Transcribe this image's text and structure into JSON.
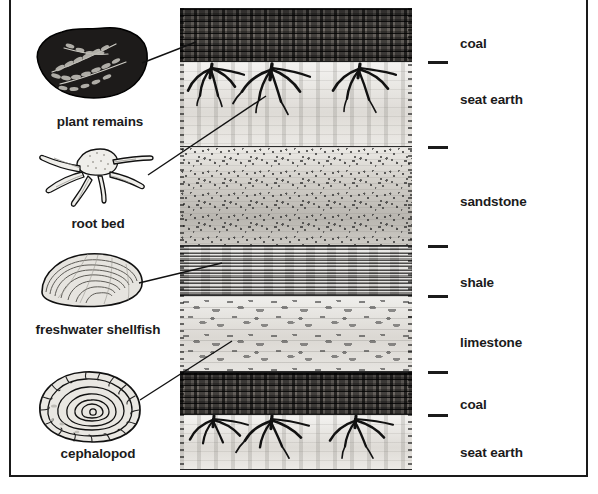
{
  "figure": {
    "type": "geological-cross-section",
    "border_color": "#1a1a1a"
  },
  "strata": {
    "column_label_ticks": 6,
    "layers": [
      {
        "id": "coal-top",
        "label": "coal",
        "rock": "coal",
        "top": 8,
        "bottom": 62,
        "label_y": 43,
        "tick_y": 62
      },
      {
        "id": "seat-earth-top",
        "label": "seat earth",
        "rock": "seat earth",
        "top": 62,
        "bottom": 147,
        "label_y": 99,
        "tick_y": 147
      },
      {
        "id": "sandstone",
        "label": "sandstone",
        "rock": "sandstone",
        "top": 147,
        "bottom": 246,
        "label_y": 201,
        "tick_y": 246
      },
      {
        "id": "shale",
        "label": "shale",
        "rock": "shale",
        "top": 246,
        "bottom": 296,
        "label_y": 282,
        "tick_y": 296
      },
      {
        "id": "limestone",
        "label": "limestone",
        "rock": "limestone",
        "top": 296,
        "bottom": 372,
        "label_y": 342,
        "tick_y": 372
      },
      {
        "id": "coal-bottom",
        "label": "coal",
        "rock": "coal",
        "top": 372,
        "bottom": 415,
        "label_y": 404,
        "tick_y": 415
      },
      {
        "id": "seat-earth-bottom",
        "label": "seat earth",
        "rock": "seat earth",
        "top": 415,
        "bottom": 470,
        "label_y": 452,
        "tick_y": null
      }
    ],
    "label_x": 460
  },
  "specimens": [
    {
      "id": "plant-remains",
      "label": "plant remains",
      "label_x": 100,
      "label_y": 122,
      "art_cx": 92,
      "art_cy": 62,
      "points_to_layer": "coal-top"
    },
    {
      "id": "root-bed",
      "label": "root bed",
      "label_x": 98,
      "label_y": 224,
      "art_cx": 95,
      "art_cy": 176,
      "points_to_layer": "seat-earth-top"
    },
    {
      "id": "freshwater-shellfish",
      "label": "freshwater shellfish",
      "label_x": 98,
      "label_y": 330,
      "art_cx": 95,
      "art_cy": 280,
      "points_to_layer": "shale"
    },
    {
      "id": "cephalopod",
      "label": "cephalopod",
      "label_x": 98,
      "label_y": 454,
      "art_cx": 92,
      "art_cy": 408,
      "points_to_layer": "limestone"
    }
  ],
  "leader_lines": [
    {
      "from_specimen": "plant-remains",
      "x1": 142,
      "y1": 63,
      "x2": 196,
      "y2": 42
    },
    {
      "from_specimen": "root-bed",
      "x1": 148,
      "y1": 175,
      "x2": 266,
      "y2": 96
    },
    {
      "from_specimen": "freshwater-shellfish",
      "x1": 139,
      "y1": 283,
      "x2": 222,
      "y2": 263
    },
    {
      "from_specimen": "cephalopod",
      "x1": 140,
      "y1": 400,
      "x2": 232,
      "y2": 341
    }
  ]
}
